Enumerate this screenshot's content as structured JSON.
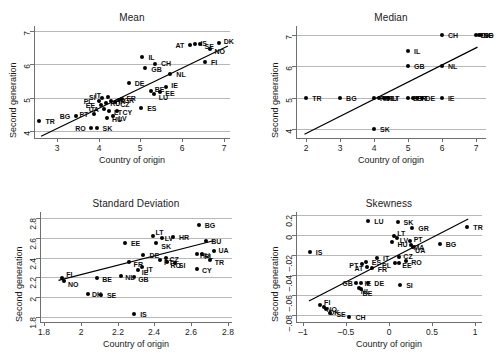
{
  "figure": {
    "axis_color": "#6f6f6f",
    "grid_color": "#b8b8b8",
    "point_color": "#000000"
  },
  "chart_data": [
    {
      "type": "scatter",
      "title": "Mean",
      "xlabel": "Country of origin",
      "ylabel": "Second generation",
      "xlim": [
        2.45,
        7.15
      ],
      "ylim": [
        3.8,
        7.15
      ],
      "xticks": [
        3,
        4,
        5,
        6,
        7
      ],
      "yticks": [
        4,
        5,
        6,
        7
      ],
      "xticklabels": [
        "3",
        "4",
        "5",
        "6",
        "7"
      ],
      "yticklabels": [
        "4",
        "5",
        "6",
        "7"
      ],
      "grid": true,
      "legend": "none",
      "fit_line": {
        "x0": 2.62,
        "y0": 3.85,
        "x1": 7.1,
        "y1": 6.55
      },
      "points": [
        {
          "label": "TR",
          "x": 2.58,
          "y": 4.3,
          "lx": 6,
          "ly": 0
        },
        {
          "label": "BG",
          "x": 3.45,
          "y": 4.45,
          "lx": -16,
          "ly": 0
        },
        {
          "label": "RO",
          "x": 3.82,
          "y": 4.1,
          "lx": -16,
          "ly": 0
        },
        {
          "label": "SK",
          "x": 3.95,
          "y": 4.1,
          "lx": 6,
          "ly": 0
        },
        {
          "label": "PT",
          "x": 3.9,
          "y": 4.52,
          "lx": -15,
          "ly": 0
        },
        {
          "label": "HU",
          "x": 4.2,
          "y": 4.4,
          "lx": 5,
          "ly": 1
        },
        {
          "label": "LV",
          "x": 4.35,
          "y": 4.47,
          "lx": 5,
          "ly": 2
        },
        {
          "label": "LT",
          "x": 4.25,
          "y": 4.62,
          "lx": 5,
          "ly": 1
        },
        {
          "label": "UA",
          "x": 4.12,
          "y": 4.68,
          "lx": -15,
          "ly": 0
        },
        {
          "label": "EE",
          "x": 4.05,
          "y": 4.78,
          "lx": -15,
          "ly": 0
        },
        {
          "label": "RU",
          "x": 4.18,
          "y": 4.85,
          "lx": 4,
          "ly": 0
        },
        {
          "label": "PL",
          "x": 4.0,
          "y": 4.9,
          "lx": -15,
          "ly": 0
        },
        {
          "label": "HR",
          "x": 4.3,
          "y": 4.92,
          "lx": 4,
          "ly": 0
        },
        {
          "label": "CZ",
          "x": 4.4,
          "y": 4.88,
          "lx": 5,
          "ly": 2
        },
        {
          "label": "SI",
          "x": 4.08,
          "y": 5.0,
          "lx": -13,
          "ly": -1
        },
        {
          "label": "GR",
          "x": 4.48,
          "y": 4.95,
          "lx": 5,
          "ly": 0
        },
        {
          "label": "IT",
          "x": 4.22,
          "y": 5.02,
          "lx": -13,
          "ly": -2
        },
        {
          "label": "FR",
          "x": 4.55,
          "y": 4.98,
          "lx": 5,
          "ly": -1
        },
        {
          "label": "CY",
          "x": 4.45,
          "y": 4.6,
          "lx": 5,
          "ly": 1
        },
        {
          "label": "ES",
          "x": 5.02,
          "y": 4.7,
          "lx": 6,
          "ly": 0
        },
        {
          "label": "DE",
          "x": 4.72,
          "y": 5.45,
          "lx": 6,
          "ly": 0
        },
        {
          "label": "BE",
          "x": 5.25,
          "y": 5.22,
          "lx": 4,
          "ly": -2
        },
        {
          "label": "LU",
          "x": 5.32,
          "y": 5.12,
          "lx": 5,
          "ly": 3
        },
        {
          "label": "EE2",
          "x": 5.48,
          "y": 5.18,
          "lx": 5,
          "ly": 1
        },
        {
          "label": "IE",
          "x": 5.62,
          "y": 5.32,
          "lx": 5,
          "ly": -2
        },
        {
          "label": "IL",
          "x": 5.05,
          "y": 6.22,
          "lx": 6,
          "ly": 0
        },
        {
          "label": "GB",
          "x": 5.12,
          "y": 5.9,
          "lx": 6,
          "ly": 1
        },
        {
          "label": "CH",
          "x": 5.35,
          "y": 6.0,
          "lx": 6,
          "ly": -1
        },
        {
          "label": "NL",
          "x": 5.72,
          "y": 5.7,
          "lx": 6,
          "ly": 0
        },
        {
          "label": "IS",
          "x": 6.32,
          "y": 6.62,
          "lx": 5,
          "ly": -1
        },
        {
          "label": "DK",
          "x": 6.88,
          "y": 6.65,
          "lx": 5,
          "ly": -2
        },
        {
          "label": "NO",
          "x": 6.68,
          "y": 6.45,
          "lx": 4,
          "ly": 2
        },
        {
          "label": "SE",
          "x": 6.42,
          "y": 6.6,
          "lx": 5,
          "ly": 2
        },
        {
          "label": "FI",
          "x": 6.55,
          "y": 6.08,
          "lx": 6,
          "ly": 0
        },
        {
          "label": "AT",
          "x": 6.18,
          "y": 6.58,
          "lx": -14,
          "ly": 0
        }
      ]
    },
    {
      "type": "scatter",
      "title": "Median",
      "xlabel": "Country of origin",
      "ylabel": "Second generation",
      "xlim": [
        1.7,
        7.3
      ],
      "ylim": [
        3.7,
        7.3
      ],
      "xticks": [
        2,
        3,
        4,
        5,
        6,
        7
      ],
      "yticks": [
        4,
        5,
        6,
        7
      ],
      "xticklabels": [
        "2",
        "3",
        "4",
        "5",
        "6",
        "7"
      ],
      "yticklabels": [
        "4",
        "5",
        "6",
        "7"
      ],
      "grid": true,
      "legend": "none",
      "fit_line": {
        "x0": 1.95,
        "y0": 3.82,
        "x1": 7.05,
        "y1": 6.62
      },
      "points": [
        {
          "label": "TR",
          "x": 2.0,
          "y": 5.0,
          "lx": 6,
          "ly": 0
        },
        {
          "label": "BG",
          "x": 3.0,
          "y": 5.0,
          "lx": 6,
          "ly": 0
        },
        {
          "label": "SK",
          "x": 4.0,
          "y": 4.0,
          "lx": 6,
          "ly": 0
        },
        {
          "label": "RO",
          "x": 4.0,
          "y": 5.0,
          "lx": 6,
          "ly": 0
        },
        {
          "label": "PT",
          "x": 4.15,
          "y": 5.0,
          "lx": 5,
          "ly": 0
        },
        {
          "label": "HU",
          "x": 4.28,
          "y": 5.0,
          "lx": 4,
          "ly": 0
        },
        {
          "label": "LT",
          "x": 4.4,
          "y": 5.0,
          "lx": 4,
          "ly": 0
        },
        {
          "label": "GB",
          "x": 5.0,
          "y": 6.0,
          "lx": 6,
          "ly": 0
        },
        {
          "label": "IL",
          "x": 5.0,
          "y": 6.5,
          "lx": 6,
          "ly": 0
        },
        {
          "label": "ES",
          "x": 5.0,
          "y": 5.0,
          "lx": 5,
          "ly": 0
        },
        {
          "label": "FR",
          "x": 5.15,
          "y": 5.0,
          "lx": 4,
          "ly": 0
        },
        {
          "label": "IT",
          "x": 5.28,
          "y": 5.0,
          "lx": 4,
          "ly": 0
        },
        {
          "label": "DE",
          "x": 5.4,
          "y": 5.0,
          "lx": 4,
          "ly": 0
        },
        {
          "label": "IE",
          "x": 6.0,
          "y": 5.0,
          "lx": 6,
          "ly": 0
        },
        {
          "label": "NL",
          "x": 6.0,
          "y": 6.0,
          "lx": 6,
          "ly": 0
        },
        {
          "label": "CH",
          "x": 6.0,
          "y": 7.0,
          "lx": 6,
          "ly": 0
        },
        {
          "label": "DK",
          "x": 7.0,
          "y": 7.0,
          "lx": 5,
          "ly": 0
        },
        {
          "label": "NO",
          "x": 7.1,
          "y": 7.0,
          "lx": 4,
          "ly": 0
        },
        {
          "label": "SE",
          "x": 7.15,
          "y": 7.0,
          "lx": 3,
          "ly": 0
        }
      ]
    },
    {
      "type": "scatter",
      "title": "Standard Deviation",
      "xlabel": "Country of origin",
      "ylabel": "Second generation",
      "xlim": [
        1.78,
        2.82
      ],
      "ylim": [
        1.75,
        2.86
      ],
      "xticks": [
        1.8,
        2.0,
        2.2,
        2.4,
        2.6,
        2.8
      ],
      "yticks": [
        1.8,
        2.0,
        2.2,
        2.4,
        2.6,
        2.8
      ],
      "xticklabels": [
        "1.8",
        "2",
        "2.2",
        "2.4",
        "2.6",
        "2.8"
      ],
      "yticklabels": [
        "1.8",
        "2",
        "2.2",
        "2.4",
        "2.6",
        "2.8"
      ],
      "grid": true,
      "legend": "none",
      "fit_line": {
        "x0": 1.88,
        "y0": 2.17,
        "x1": 2.72,
        "y1": 2.57
      },
      "points": [
        {
          "label": "FI",
          "x": 1.9,
          "y": 2.19,
          "lx": 4,
          "ly": -4
        },
        {
          "label": "NO",
          "x": 1.91,
          "y": 2.16,
          "lx": 4,
          "ly": 3
        },
        {
          "label": "DK",
          "x": 2.04,
          "y": 2.03,
          "lx": 4,
          "ly": 0
        },
        {
          "label": "SE",
          "x": 2.11,
          "y": 2.02,
          "lx": 6,
          "ly": 0
        },
        {
          "label": "BE",
          "x": 2.09,
          "y": 2.19,
          "lx": 5,
          "ly": 1
        },
        {
          "label": "NL",
          "x": 2.22,
          "y": 2.21,
          "lx": 4,
          "ly": 1
        },
        {
          "label": "GB",
          "x": 2.29,
          "y": 2.2,
          "lx": 4,
          "ly": 2
        },
        {
          "label": "IE",
          "x": 2.31,
          "y": 2.27,
          "lx": 4,
          "ly": 2
        },
        {
          "label": "FR",
          "x": 2.26,
          "y": 2.36,
          "lx": 5,
          "ly": 2
        },
        {
          "label": "IT",
          "x": 2.33,
          "y": 2.31,
          "lx": 5,
          "ly": 2
        },
        {
          "label": "EE",
          "x": 2.24,
          "y": 2.55,
          "lx": 6,
          "ly": 0
        },
        {
          "label": "DE",
          "x": 2.34,
          "y": 2.43,
          "lx": 6,
          "ly": 0
        },
        {
          "label": "IS",
          "x": 2.29,
          "y": 1.83,
          "lx": 6,
          "ly": 0
        },
        {
          "label": "LT",
          "x": 2.39,
          "y": 2.62,
          "lx": 3,
          "ly": -4
        },
        {
          "label": "SK",
          "x": 2.41,
          "y": 2.55,
          "lx": 5,
          "ly": 3
        },
        {
          "label": "LV",
          "x": 2.44,
          "y": 2.6,
          "lx": 3,
          "ly": 0
        },
        {
          "label": "HR",
          "x": 2.5,
          "y": 2.61,
          "lx": 6,
          "ly": 0
        },
        {
          "label": "CZ",
          "x": 2.46,
          "y": 2.4,
          "lx": 4,
          "ly": 1
        },
        {
          "label": "PT",
          "x": 2.43,
          "y": 2.38,
          "lx": 4,
          "ly": 2
        },
        {
          "label": "RO",
          "x": 2.47,
          "y": 2.36,
          "lx": 3,
          "ly": 3
        },
        {
          "label": "SI",
          "x": 2.51,
          "y": 2.35,
          "lx": 4,
          "ly": 2
        },
        {
          "label": "BG",
          "x": 2.64,
          "y": 2.73,
          "lx": 6,
          "ly": 0
        },
        {
          "label": "BU",
          "x": 2.68,
          "y": 2.57,
          "lx": 5,
          "ly": 0
        },
        {
          "label": "HU",
          "x": 2.63,
          "y": 2.44,
          "lx": 3,
          "ly": 1
        },
        {
          "label": "PL",
          "x": 2.66,
          "y": 2.44,
          "lx": 2,
          "ly": 2
        },
        {
          "label": "UA",
          "x": 2.72,
          "y": 2.47,
          "lx": 5,
          "ly": -1
        },
        {
          "label": "TR",
          "x": 2.7,
          "y": 2.38,
          "lx": 5,
          "ly": 2
        },
        {
          "label": "CY",
          "x": 2.63,
          "y": 2.28,
          "lx": 5,
          "ly": 1
        }
      ]
    },
    {
      "type": "scatter",
      "title": "Skewness",
      "xlabel": "Country of origin",
      "ylabel": "Second generation",
      "xlim": [
        -1.08,
        1.08
      ],
      "ylim": [
        -0.87,
        0.23
      ],
      "xticks": [
        -1,
        -0.5,
        0,
        0.5,
        1
      ],
      "yticks": [
        0.2,
        0,
        -0.2,
        -0.4,
        -0.6,
        -0.8
      ],
      "xticklabels": [
        "–1",
        "–0.5",
        "0",
        "0.5",
        "1"
      ],
      "yticklabels": [
        "0.2",
        "0",
        "–.02",
        "–.04",
        "–.06",
        "–.08"
      ],
      "grid": true,
      "legend": "none",
      "fit_line": {
        "x0": -0.93,
        "y0": -0.66,
        "x1": 0.92,
        "y1": 0.16
      },
      "points": [
        {
          "label": "IS",
          "x": -0.92,
          "y": -0.17,
          "lx": 6,
          "ly": 0
        },
        {
          "label": "FI",
          "x": -0.8,
          "y": -0.7,
          "lx": 4,
          "ly": -3
        },
        {
          "label": "NO",
          "x": -0.76,
          "y": -0.72,
          "lx": 3,
          "ly": 2
        },
        {
          "label": "DK",
          "x": -0.73,
          "y": -0.74,
          "lx": 3,
          "ly": 3
        },
        {
          "label": "SE",
          "x": -0.68,
          "y": -0.78,
          "lx": 6,
          "ly": 1
        },
        {
          "label": "CH",
          "x": -0.46,
          "y": -0.82,
          "lx": 6,
          "ly": 0
        },
        {
          "label": "GB",
          "x": -0.38,
          "y": -0.48,
          "lx": -14,
          "ly": 0
        },
        {
          "label": "IE",
          "x": -0.32,
          "y": -0.48,
          "lx": 3,
          "ly": 0
        },
        {
          "label": "NL",
          "x": -0.35,
          "y": -0.53,
          "lx": 2,
          "ly": 3
        },
        {
          "label": "BE",
          "x": -0.33,
          "y": -0.54,
          "lx": 2,
          "ly": 4
        },
        {
          "label": "DE",
          "x": -0.24,
          "y": -0.48,
          "lx": 6,
          "ly": 0
        },
        {
          "label": "LU",
          "x": -0.24,
          "y": 0.14,
          "lx": 6,
          "ly": 0
        },
        {
          "label": "ES",
          "x": -0.27,
          "y": -0.27,
          "lx": 6,
          "ly": 0
        },
        {
          "label": "PT",
          "x": -0.31,
          "y": -0.29,
          "lx": -13,
          "ly": 1
        },
        {
          "label": "AT",
          "x": -0.25,
          "y": -0.32,
          "lx": -13,
          "ly": 1
        },
        {
          "label": "FR",
          "x": -0.2,
          "y": -0.33,
          "lx": 6,
          "ly": 1
        },
        {
          "label": "IT",
          "x": -0.14,
          "y": -0.23,
          "lx": 6,
          "ly": 0
        },
        {
          "label": "SK",
          "x": 0.1,
          "y": 0.13,
          "lx": 6,
          "ly": 0
        },
        {
          "label": "GR",
          "x": 0.27,
          "y": 0.07,
          "lx": 6,
          "ly": 0
        },
        {
          "label": "LT",
          "x": 0.06,
          "y": -0.01,
          "lx": 3,
          "ly": -3
        },
        {
          "label": "LV",
          "x": 0.09,
          "y": -0.03,
          "lx": 3,
          "ly": 2
        },
        {
          "label": "HU",
          "x": 0.04,
          "y": -0.07,
          "lx": 5,
          "ly": 2
        },
        {
          "label": "PT2",
          "x": 0.24,
          "y": -0.06,
          "lx": 4,
          "ly": -2
        },
        {
          "label": "MA",
          "x": 0.25,
          "y": -0.1,
          "lx": 3,
          "ly": 2
        },
        {
          "label": "UA",
          "x": 0.28,
          "y": -0.12,
          "lx": 2,
          "ly": 3
        },
        {
          "label": "CZ",
          "x": 0.12,
          "y": -0.22,
          "lx": 4,
          "ly": -1
        },
        {
          "label": "EE",
          "x": 0.12,
          "y": -0.28,
          "lx": 3,
          "ly": 2
        },
        {
          "label": "RO",
          "x": 0.2,
          "y": -0.26,
          "lx": 5,
          "ly": 1
        },
        {
          "label": "PL",
          "x": 0.07,
          "y": -0.28,
          "lx": -13,
          "ly": 2
        },
        {
          "label": "BG",
          "x": 0.59,
          "y": -0.09,
          "lx": 6,
          "ly": 0
        },
        {
          "label": "TR",
          "x": 0.91,
          "y": 0.08,
          "lx": 6,
          "ly": 0
        },
        {
          "label": "SI",
          "x": 0.13,
          "y": -0.5,
          "lx": 6,
          "ly": 0
        }
      ]
    }
  ]
}
